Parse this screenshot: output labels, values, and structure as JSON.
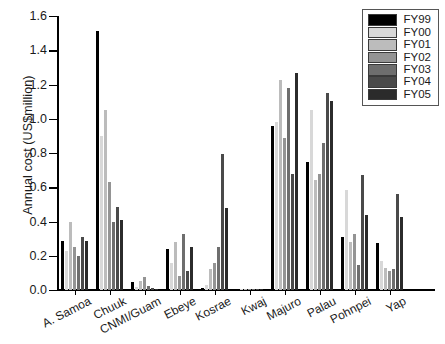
{
  "chart_data": {
    "type": "bar",
    "title": "",
    "xlabel": "",
    "ylabel": "Annual cost (US$million)",
    "ylim": [
      0.0,
      1.6
    ],
    "yticks": [
      "0.0",
      "0.2",
      "0.4",
      "0.6",
      "0.8",
      "1.0",
      "1.2",
      "1.4",
      "1.6"
    ],
    "grid": false,
    "legend_position": "top-right",
    "categories": [
      "A. Samoa",
      "Chuuk",
      "CNMI/Guam",
      "Ebeye",
      "Kosrae",
      "Kwaj",
      "Majuro",
      "Palau",
      "Pohnpei",
      "Yap"
    ],
    "series": [
      {
        "name": "FY99",
        "color": "#000000",
        "values": [
          0.285,
          1.515,
          0.045,
          0.24,
          0.01,
          0.002,
          0.96,
          0.75,
          0.31,
          0.275
        ]
      },
      {
        "name": "FY00",
        "color": "#d8d8d8",
        "values": [
          0.23,
          0.9,
          0.02,
          0.155,
          0.03,
          0.002,
          0.98,
          1.05,
          0.585,
          0.17
        ]
      },
      {
        "name": "FY01",
        "color": "#bcbcbc",
        "values": [
          0.4,
          1.05,
          0.05,
          0.28,
          0.12,
          0.002,
          1.225,
          0.64,
          0.28,
          0.13
        ]
      },
      {
        "name": "FY02",
        "color": "#949494",
        "values": [
          0.25,
          0.63,
          0.075,
          0.08,
          0.16,
          0.002,
          0.89,
          0.68,
          0.33,
          0.11
        ]
      },
      {
        "name": "FY03",
        "color": "#6e6e6e",
        "values": [
          0.2,
          0.4,
          0.025,
          0.33,
          0.25,
          0.002,
          1.18,
          0.86,
          0.145,
          0.12
        ]
      },
      {
        "name": "FY04",
        "color": "#4a4a4a",
        "values": [
          0.31,
          0.485,
          0.01,
          0.11,
          0.795,
          0.005,
          0.68,
          1.15,
          0.67,
          0.56
        ]
      },
      {
        "name": "FY05",
        "color": "#2b2b2b",
        "values": [
          0.285,
          0.41,
          0.005,
          0.25,
          0.48,
          0.002,
          1.265,
          1.105,
          0.44,
          0.425
        ]
      }
    ]
  }
}
